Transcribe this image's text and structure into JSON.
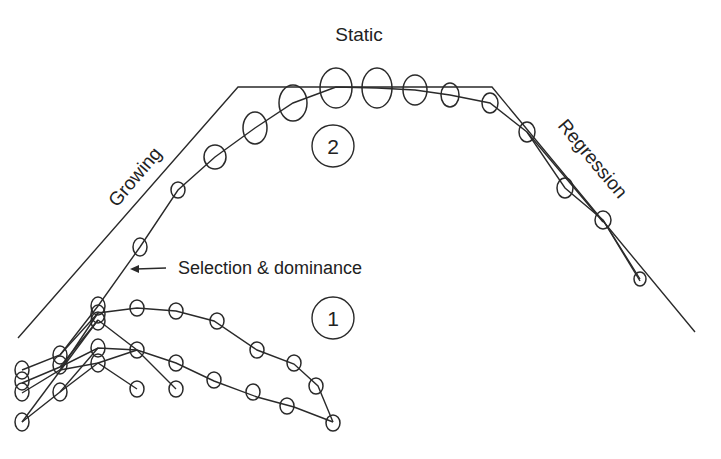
{
  "diagram": {
    "labels": {
      "top": "Static",
      "left_phase": "Growing",
      "right_phase": "Regression",
      "annotation": "Selection & dominance"
    },
    "badges": [
      {
        "id": "2",
        "label": "2"
      },
      {
        "id": "1",
        "label": "1"
      }
    ],
    "colors": {
      "stroke": "#2a2a2a",
      "background": "#ffffff",
      "text": "#222222"
    },
    "envelope": [
      [
        18,
        338
      ],
      [
        238,
        87
      ],
      [
        492,
        87
      ],
      [
        695,
        332
      ]
    ],
    "main_chain": [
      [
        60,
        355,
        8,
        11
      ],
      [
        98,
        306,
        9,
        10
      ],
      [
        140,
        247,
        8,
        10
      ],
      [
        178,
        190,
        8,
        10
      ],
      [
        215,
        157,
        11,
        12
      ],
      [
        255,
        128,
        12,
        14
      ],
      [
        293,
        103,
        15,
        19
      ],
      [
        336,
        82,
        16,
        20
      ],
      [
        377,
        82,
        16,
        20
      ],
      [
        415,
        87,
        12,
        15
      ],
      [
        450,
        95,
        10,
        12
      ],
      [
        490,
        103,
        8,
        10
      ],
      [
        527,
        132,
        9,
        10
      ],
      [
        565,
        188,
        9,
        10
      ],
      [
        603,
        220,
        10,
        10
      ],
      [
        640,
        279,
        8,
        8
      ]
    ],
    "sub_chains": [
      [
        [
          22,
          370
        ],
        [
          60,
          355
        ],
        [
          98,
          313
        ],
        [
          137,
          308
        ],
        [
          176,
          311
        ],
        [
          214,
          321
        ],
        [
          257,
          350
        ],
        [
          294,
          364
        ],
        [
          318,
          386
        ],
        [
          333,
          422
        ]
      ],
      [
        [
          22,
          383
        ],
        [
          60,
          367
        ],
        [
          98,
          348
        ],
        [
          137,
          350
        ],
        [
          176,
          363
        ],
        [
          214,
          381
        ],
        [
          257,
          397
        ],
        [
          294,
          407
        ],
        [
          333,
          422
        ]
      ],
      [
        [
          22,
          393
        ],
        [
          60,
          392
        ],
        [
          98,
          363
        ],
        [
          137,
          389
        ],
        [
          176,
          389
        ]
      ],
      [
        [
          22,
          422
        ],
        [
          98,
          320
        ]
      ],
      [
        [
          22,
          422
        ],
        [
          60,
          392
        ]
      ]
    ]
  }
}
